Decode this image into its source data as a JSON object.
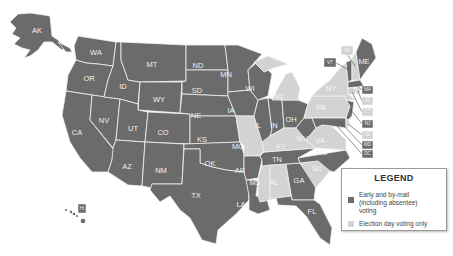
{
  "map": {
    "legend": {
      "title": "LEGEND",
      "items": [
        {
          "key": "early",
          "label": "Early and by-mail (including absentee) voting",
          "color": "#6b6b6b"
        },
        {
          "key": "eday",
          "label": "Election day voting only",
          "color": "#d3d3d3"
        }
      ]
    },
    "colors": {
      "early": "#6b6b6b",
      "eday": "#d3d3d3"
    },
    "states": {
      "AK": {
        "abbr": "AK",
        "category": "early"
      },
      "WA": {
        "abbr": "WA",
        "category": "early"
      },
      "OR": {
        "abbr": "OR",
        "category": "early"
      },
      "CA": {
        "abbr": "CA",
        "category": "early"
      },
      "NV": {
        "abbr": "NV",
        "category": "early"
      },
      "ID": {
        "abbr": "ID",
        "category": "early"
      },
      "MT": {
        "abbr": "MT",
        "category": "early"
      },
      "WY": {
        "abbr": "WY",
        "category": "early"
      },
      "UT": {
        "abbr": "UT",
        "category": "early"
      },
      "CO": {
        "abbr": "CO",
        "category": "early"
      },
      "AZ": {
        "abbr": "AZ",
        "category": "early"
      },
      "NM": {
        "abbr": "NM",
        "category": "early"
      },
      "ND": {
        "abbr": "ND",
        "category": "early"
      },
      "SD": {
        "abbr": "SD",
        "category": "early"
      },
      "NE": {
        "abbr": "NE",
        "category": "early"
      },
      "KS": {
        "abbr": "KS",
        "category": "early"
      },
      "OK": {
        "abbr": "OK",
        "category": "early"
      },
      "TX": {
        "abbr": "TX",
        "category": "early"
      },
      "MN": {
        "abbr": "MN",
        "category": "early"
      },
      "IA": {
        "abbr": "IA",
        "category": "early"
      },
      "MO": {
        "abbr": "MO",
        "category": "eday"
      },
      "AR": {
        "abbr": "AR",
        "category": "early"
      },
      "LA": {
        "abbr": "LA",
        "category": "early"
      },
      "WI": {
        "abbr": "WI",
        "category": "early"
      },
      "IL": {
        "abbr": "IL",
        "category": "early"
      },
      "MI": {
        "abbr": "MI",
        "category": "eday"
      },
      "IN": {
        "abbr": "IN",
        "category": "early"
      },
      "OH": {
        "abbr": "OH",
        "category": "early"
      },
      "KY": {
        "abbr": "KY",
        "category": "eday"
      },
      "TN": {
        "abbr": "TN",
        "category": "early"
      },
      "MS": {
        "abbr": "MS",
        "category": "eday"
      },
      "AL": {
        "abbr": "AL",
        "category": "eday"
      },
      "GA": {
        "abbr": "GA",
        "category": "early"
      },
      "FL": {
        "abbr": "FL",
        "category": "early"
      },
      "SC": {
        "abbr": "SC",
        "category": "eday"
      },
      "NC": {
        "abbr": "NC",
        "category": "early"
      },
      "VA": {
        "abbr": "VA",
        "category": "eday"
      },
      "WV": {
        "abbr": "WV",
        "category": "early"
      },
      "PA": {
        "abbr": "PA",
        "category": "eday"
      },
      "NY": {
        "abbr": "NY",
        "category": "eday"
      },
      "VT": {
        "abbr": "VT",
        "category": "early"
      },
      "NH": {
        "abbr": "NH",
        "category": "eday"
      },
      "ME": {
        "abbr": "ME",
        "category": "early"
      },
      "MA": {
        "abbr": "MA",
        "category": "early"
      },
      "RI": {
        "abbr": "RI",
        "category": "eday"
      },
      "CT": {
        "abbr": "CT",
        "category": "eday"
      },
      "NJ": {
        "abbr": "NJ",
        "category": "early"
      },
      "DE": {
        "abbr": "DE",
        "category": "eday"
      },
      "MD": {
        "abbr": "MD",
        "category": "early"
      },
      "DC": {
        "abbr": "DC",
        "category": "early"
      },
      "HI": {
        "abbr": "HI",
        "category": "early"
      }
    }
  }
}
